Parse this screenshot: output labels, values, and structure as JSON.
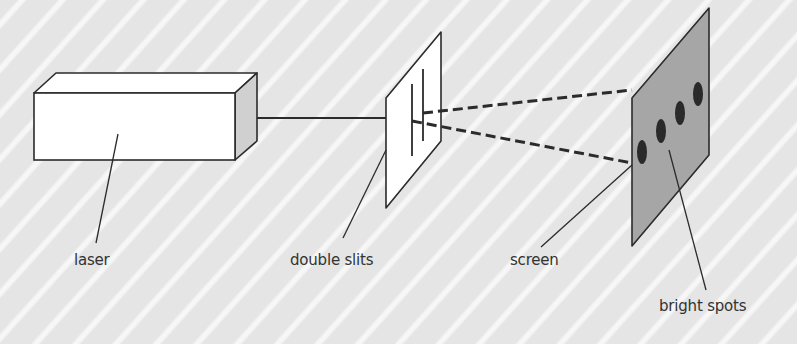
{
  "diagram": {
    "title": "",
    "colors": {
      "background": "#e5e5e5",
      "stripe": "#f8f8f8",
      "outline": "#2b2b2b",
      "laser_front": "#ffffff",
      "laser_side": "#d0d0d0",
      "slit_panel": "#ffffff",
      "screen_fill": "#a6a6a6",
      "spot_fill": "#2a2a2a",
      "text": "#333333"
    },
    "components": [
      {
        "id": "laser",
        "label": "laser"
      },
      {
        "id": "double-slits",
        "label": "double slits"
      },
      {
        "id": "screen",
        "label": "screen"
      },
      {
        "id": "bright-spots",
        "label": "bright spots",
        "count": 4
      }
    ],
    "labels": {
      "laser": "laser",
      "double_slits": "double slits",
      "screen": "screen",
      "bright_spots": "bright spots"
    }
  }
}
